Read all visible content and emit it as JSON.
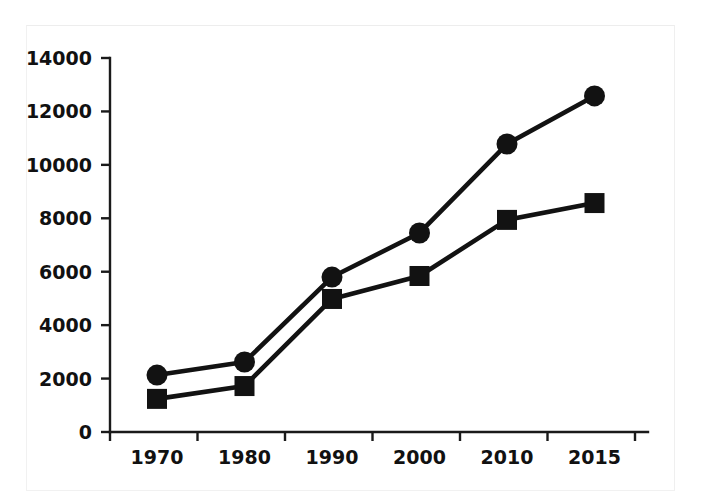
{
  "chart_data": {
    "type": "line",
    "title": "",
    "subtitle": "",
    "xlabel": "",
    "ylabel": "",
    "categories": [
      "1970",
      "1980",
      "1990",
      "2000",
      "2010",
      "2015"
    ],
    "ylim": [
      0,
      14000
    ],
    "y_ticks": [
      0,
      2000,
      4000,
      6000,
      8000,
      10000,
      12000,
      14000
    ],
    "y_tick_labels": [
      "0",
      "2000",
      "4000",
      "6000",
      "8000",
      "10000",
      "12000",
      "14000"
    ],
    "x_tick_labels": [
      "1970",
      "1980",
      "1990",
      "2000",
      "2010",
      "2015"
    ],
    "grid": false,
    "legend": false,
    "legend_position": "none",
    "series": [
      {
        "name": "series-circle",
        "marker": "circle",
        "color": "#121212",
        "values": [
          2130,
          2620,
          5800,
          7450,
          10780,
          12580
        ]
      },
      {
        "name": "series-square",
        "marker": "square",
        "color": "#121212",
        "values": [
          1240,
          1720,
          4980,
          5840,
          7940,
          8570
        ]
      }
    ]
  },
  "colors": {
    "ink": "#121212",
    "axis": "#1a1a1a",
    "background": "#ffffff",
    "border": "#f1f1f1"
  }
}
